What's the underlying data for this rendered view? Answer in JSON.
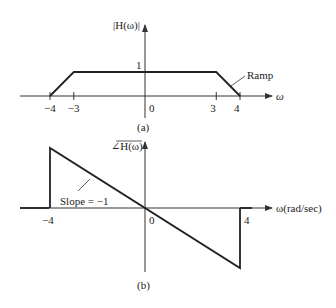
{
  "plot_a": {
    "ylabel": "|H(ω)|",
    "xlabel": "ω",
    "caption": "(a)",
    "annotation": "Ramp",
    "y_tick_label": "1",
    "x_ticks": [
      {
        "value": -4,
        "label": "−4"
      },
      {
        "value": -3,
        "label": "−3"
      },
      {
        "value": 0,
        "label": "0"
      },
      {
        "value": 3,
        "label": "3"
      },
      {
        "value": 4,
        "label": "4"
      }
    ],
    "curve": [
      [
        -4,
        0
      ],
      [
        -3,
        1
      ],
      [
        3,
        1
      ],
      [
        4,
        0
      ]
    ]
  },
  "plot_b": {
    "ylabel": "∠H(ω)",
    "xlabel": "ω(rad/sec)",
    "caption": "(b)",
    "annotation": "Slope = −1",
    "x_ticks": [
      {
        "value": -4,
        "label": "−4"
      },
      {
        "value": 0,
        "label": "0"
      },
      {
        "value": 4,
        "label": "4"
      }
    ],
    "curve": [
      [
        -4,
        0
      ],
      [
        -4,
        4
      ],
      [
        4,
        -4
      ],
      [
        4,
        0
      ]
    ]
  },
  "colors": {
    "line": "#222222",
    "axis": "#333333"
  }
}
